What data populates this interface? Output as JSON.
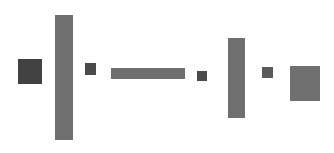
{
  "canvas": {
    "width": 334,
    "height": 153,
    "background": "#ffffff",
    "title": "Gray rectangles composition"
  },
  "shapes": [
    {
      "name": "rect-1-small-dark-square",
      "label": "square",
      "x": 18,
      "y": 59,
      "width": 24,
      "height": 25,
      "color": "#424242"
    },
    {
      "name": "rect-2-tall-bar",
      "label": "tall vertical bar",
      "x": 55,
      "y": 15,
      "width": 18,
      "height": 125,
      "color": "#6f6f6f"
    },
    {
      "name": "rect-3-tiny-square",
      "label": "tiny square",
      "x": 85,
      "y": 63,
      "width": 11,
      "height": 12,
      "color": "#4a4a4a"
    },
    {
      "name": "rect-4-long-horizontal-bar",
      "label": "long horizontal bar",
      "x": 111,
      "y": 68,
      "width": 74,
      "height": 11,
      "color": "#6f6f6f"
    },
    {
      "name": "rect-5-tiny-square",
      "label": "tiny square",
      "x": 197,
      "y": 71,
      "width": 10,
      "height": 10,
      "color": "#4a4a4a"
    },
    {
      "name": "rect-6-tall-bar",
      "label": "tall vertical bar",
      "x": 228,
      "y": 38,
      "width": 17,
      "height": 80,
      "color": "#6f6f6f"
    },
    {
      "name": "rect-7-tiny-square",
      "label": "tiny square",
      "x": 262,
      "y": 67,
      "width": 11,
      "height": 11,
      "color": "#5a5a5a"
    },
    {
      "name": "rect-8-medium-square",
      "label": "medium rectangle",
      "x": 290,
      "y": 66,
      "width": 30,
      "height": 35,
      "color": "#707070"
    }
  ]
}
